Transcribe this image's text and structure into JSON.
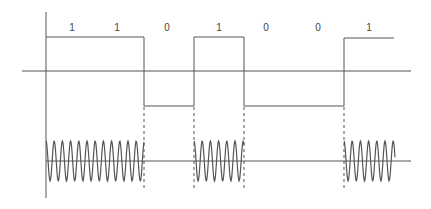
{
  "colors": {
    "line": "#444444",
    "background": "#ffffff"
  },
  "bits": [
    {
      "value": "1",
      "x": 72
    },
    {
      "value": "1",
      "x": 117
    },
    {
      "value": "0",
      "x": 167
    },
    {
      "value": "1",
      "x": 219
    },
    {
      "value": "0",
      "x": 266
    },
    {
      "value": "0",
      "x": 318
    },
    {
      "value": "1",
      "x": 369
    }
  ],
  "digital_signal": {
    "high_y": 37,
    "zero_y": 71,
    "low_y": 106,
    "transitions_x": [
      46,
      144,
      194,
      244,
      344,
      394
    ]
  },
  "carrier": {
    "center_y": 161,
    "amplitude": 20,
    "period": 8.2,
    "bursts": [
      {
        "start_x": 46,
        "end_x": 144
      },
      {
        "start_x": 194,
        "end_x": 244
      },
      {
        "start_x": 344,
        "end_x": 395
      }
    ]
  }
}
